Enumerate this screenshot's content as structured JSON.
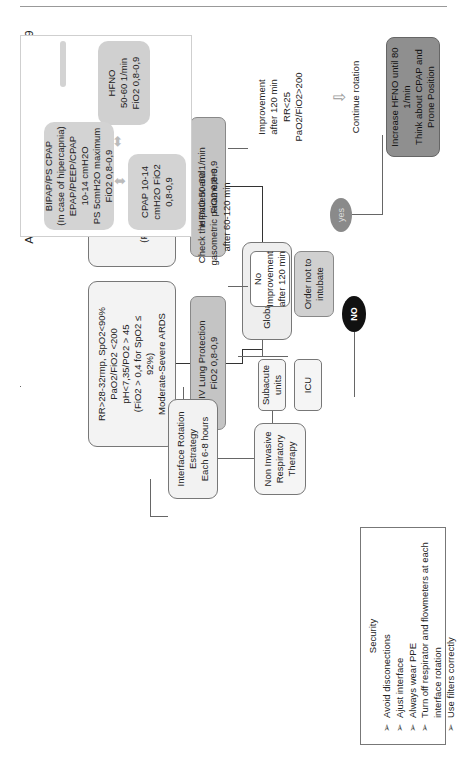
{
  "title": {
    "line1": "Algorithm non invasive therapy COVID-19",
    "line2": "Older Patients and Subacute units"
  },
  "criteria": [
    {
      "lines": [
        "RR>28-32rmp,",
        "SpO2<90%",
        "PaO2/FiO2 <200",
        "(FiO2 > 0,4 for SpO2 ≤92%",
        "Moderate-Severe ARDS"
      ]
    },
    {
      "lines": [
        "RR>28-32rmp, SpO2<90%",
        "PaO2/FiO2 <200",
        "pH<7,35/PO2 > 45",
        "(FiO2 > 0,4 for SpO2 ≤",
        "92%)",
        "Moderate-Severe ARDS"
      ]
    }
  ],
  "therapy_boxes": {
    "hfno": [
      "HFNO 50-60 1/min",
      "FiO2 0,8-0,9"
    ],
    "niv": [
      "NIV Lung Protection",
      "FiO2 0,8-0,9"
    ]
  },
  "global_assistment": "Global assistment",
  "units": {
    "subacute": [
      "Subacute",
      "units"
    ],
    "icu": "ICU"
  },
  "niv_therapy": [
    "Non Invasive",
    "Respiratory",
    "Therapy"
  ],
  "rotation": [
    "Interface Rotation",
    "Estrategy",
    "Each 6-8 hours"
  ],
  "interfaces": {
    "hfno": [
      "HFNO",
      "50-60 1/min",
      "FiO2 0,8-0,9"
    ],
    "cpap": [
      "CPAP 10-14",
      "cmH2O FiO2",
      "0,8-0,9"
    ],
    "bipap": [
      "BIPAP/PS CPAP",
      "(In case of hipercapnia)",
      "EPAP/PEEP/CPAP",
      "10-14 cmH2O",
      "PS 5cmH2O maximum",
      "FiO2 0,8-0,9"
    ]
  },
  "check": [
    "Check the patient and",
    "gasometric parameters",
    "after 60-120 min"
  ],
  "improvement": [
    "Improvement",
    "after 120 min",
    "RR<25",
    "PaO2/FiO2>200"
  ],
  "continue_rotation": "Continue rotation",
  "no_improvement": [
    "No Improvement",
    "after 120 min"
  ],
  "order_not_intubate": [
    "Order not to",
    "intubate"
  ],
  "yes_label": "yes",
  "no_label": "NO",
  "increase": [
    "Increase HFNO until 80",
    "1/min",
    "Think about CPAP and",
    "Prone Position"
  ],
  "security": {
    "title": "Security",
    "items": [
      "Avoid disconections",
      "Ajust interface",
      "Always wear PPE",
      "Turn off respirator and flowmeters at each interface rotation",
      "Use filters correctly"
    ],
    "bullet": "➢"
  },
  "colors": {
    "gray_box": "#c4c4c4",
    "light_gray_box": "#d3d3d3",
    "dark_box": "#8f8f8f",
    "yes_oval": "#8a8a8a",
    "no_oval": "#111111"
  }
}
